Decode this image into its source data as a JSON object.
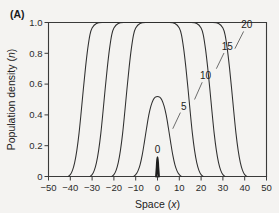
{
  "panel": {
    "label": "(A)"
  },
  "chart_data": {
    "type": "line",
    "title": "",
    "subtitle": "",
    "xlabel": "Space (x)",
    "xlabel_text": "Space",
    "xlabel_var": "x",
    "ylabel": "Population density (n)",
    "ylabel_text": "Population density",
    "ylabel_var": "n",
    "xlim": [
      -50,
      50
    ],
    "ylim": [
      0,
      1.0
    ],
    "grid": false,
    "legend_position": "inline-annotations",
    "xticks": [
      -50,
      -40,
      -30,
      -20,
      -10,
      0,
      10,
      20,
      30,
      40,
      50
    ],
    "xticklabels": [
      "−50",
      "−40",
      "−30",
      "−20",
      "−10",
      "0",
      "10",
      "20",
      "30",
      "40",
      "50"
    ],
    "yticks": [
      0,
      0.2,
      0.4,
      0.6,
      0.8,
      1.0
    ],
    "yticklabels": [
      "0",
      "0.2",
      "0.4",
      "0.6",
      "0.8",
      "1.0"
    ],
    "annotations": [
      {
        "text": "0",
        "x": 0,
        "y": 0.175
      },
      {
        "text": "5",
        "x": 12,
        "y": 0.455
      },
      {
        "text": "10",
        "x": 22,
        "y": 0.655
      },
      {
        "text": "15",
        "x": 32,
        "y": 0.845
      },
      {
        "text": "20",
        "x": 41,
        "y": 0.985
      }
    ],
    "series": [
      {
        "name": "0",
        "label": "0",
        "description": "initial point release spike at origin",
        "x": [
          -0.6,
          -0.3,
          0,
          0.3,
          0.6
        ],
        "values": [
          0,
          0.06,
          0.125,
          0.06,
          0
        ]
      },
      {
        "name": "5",
        "label": "5",
        "description": "early diffusing hump, peak below half saturation",
        "x": [
          -11,
          -10,
          -9,
          -8,
          -7,
          -6,
          -5,
          -4,
          -3,
          -2,
          -1,
          0,
          1,
          2,
          3,
          4,
          5,
          6,
          7,
          8,
          9,
          10,
          11
        ],
        "values": [
          0,
          0.012,
          0.035,
          0.075,
          0.14,
          0.225,
          0.315,
          0.398,
          0.458,
          0.497,
          0.515,
          0.52,
          0.515,
          0.497,
          0.458,
          0.398,
          0.315,
          0.225,
          0.14,
          0.075,
          0.035,
          0.012,
          0
        ]
      },
      {
        "name": "10",
        "label": "10",
        "description": "travelling wave front, saturated plateau near centre",
        "x": [
          -21,
          -20,
          -19,
          -18,
          -17,
          -16,
          -15,
          -14,
          -13,
          -12,
          -11,
          -10,
          -8,
          -5,
          0,
          5,
          8,
          10,
          11,
          12,
          13,
          14,
          15,
          16,
          17,
          18,
          19,
          20,
          21
        ],
        "values": [
          0,
          0.012,
          0.04,
          0.09,
          0.17,
          0.28,
          0.42,
          0.57,
          0.71,
          0.83,
          0.92,
          0.965,
          0.993,
          1.0,
          1.0,
          1.0,
          0.993,
          0.965,
          0.92,
          0.83,
          0.71,
          0.57,
          0.42,
          0.28,
          0.17,
          0.09,
          0.04,
          0.012,
          0
        ]
      },
      {
        "name": "15",
        "label": "15",
        "description": "travelling wave front at intermediate time",
        "x": [
          -31,
          -30,
          -29,
          -28,
          -27,
          -26,
          -25,
          -24,
          -23,
          -22,
          -21,
          -20,
          -18,
          -15,
          -10,
          0,
          10,
          15,
          18,
          20,
          21,
          22,
          23,
          24,
          25,
          26,
          27,
          28,
          29,
          30,
          31
        ],
        "values": [
          0,
          0.012,
          0.04,
          0.09,
          0.17,
          0.28,
          0.42,
          0.57,
          0.71,
          0.83,
          0.92,
          0.965,
          0.993,
          1.0,
          1.0,
          1.0,
          1.0,
          1.0,
          0.993,
          0.965,
          0.92,
          0.83,
          0.71,
          0.57,
          0.42,
          0.28,
          0.17,
          0.09,
          0.04,
          0.012,
          0
        ]
      },
      {
        "name": "20",
        "label": "20",
        "description": "travelling wave front at latest time, widest plateau",
        "x": [
          -41,
          -40,
          -39,
          -38,
          -37,
          -36,
          -35,
          -34,
          -33,
          -32,
          -31,
          -30,
          -28,
          -25,
          -20,
          -10,
          0,
          10,
          20,
          25,
          28,
          30,
          31,
          32,
          33,
          34,
          35,
          36,
          37,
          38,
          39,
          40,
          41
        ],
        "values": [
          0,
          0.012,
          0.04,
          0.09,
          0.17,
          0.28,
          0.42,
          0.57,
          0.71,
          0.83,
          0.92,
          0.965,
          0.993,
          1.0,
          1.0,
          1.0,
          1.0,
          1.0,
          1.0,
          1.0,
          0.993,
          0.965,
          0.92,
          0.83,
          0.71,
          0.57,
          0.42,
          0.28,
          0.17,
          0.09,
          0.04,
          0.012,
          0
        ]
      }
    ],
    "colors": {
      "line": "#2f2f2f",
      "axis": "#3a3a3a",
      "text": "#222222",
      "background": "#f4f3f1"
    }
  }
}
